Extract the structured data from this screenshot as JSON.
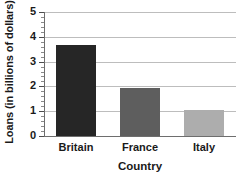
{
  "chart_data": {
    "type": "bar",
    "title": "",
    "categories": [
      "Britain",
      "France",
      "Italy"
    ],
    "values": [
      3.65,
      1.93,
      1.05
    ],
    "series": [
      {
        "name": "Loans",
        "values": [
          3.65,
          1.93,
          1.05
        ],
        "colors": [
          "#262626",
          "#5e5e5e",
          "#adadad"
        ]
      }
    ],
    "xlabel": "Country",
    "ylabel": "Loans (in billions of dollars)",
    "ylim": [
      0,
      5
    ],
    "ytick_labels": [
      "0",
      "1",
      "2",
      "3",
      "4",
      "5"
    ],
    "ytick_values": [
      0,
      1,
      2,
      3,
      4,
      5
    ],
    "minor_ticks_per_interval": 4,
    "grid": true,
    "grid_axis": "y",
    "legend": false,
    "legend_position": "none",
    "colors": {
      "grid": "#bdbdbd",
      "axis": "#6e6e6e",
      "text": "#1a1a1a",
      "background": "#ffffff",
      "bar_britain": "#262626",
      "bar_france": "#5e5e5e",
      "bar_italy": "#adadad"
    }
  }
}
